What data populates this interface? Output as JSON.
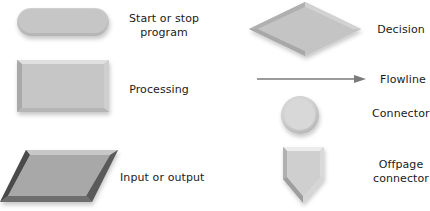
{
  "diagram": {
    "colors": {
      "fill": "#c4c4c4",
      "fill_light": "#d6d6d6",
      "bevel_dark": "#8a8a8a",
      "bevel_darker": "#555555",
      "bevel_light": "#e6e6e6",
      "flowline": "#7a7a7a",
      "text": "#1a1a1a"
    },
    "symbols": [
      {
        "id": "terminal",
        "shape": "rounded-rectangle",
        "label_line1": "Start or stop",
        "label_line2": "program"
      },
      {
        "id": "process",
        "shape": "rectangle",
        "label": "Processing"
      },
      {
        "id": "input-output",
        "shape": "parallelogram",
        "label": "Input or output"
      },
      {
        "id": "decision",
        "shape": "diamond",
        "label": "Decision"
      },
      {
        "id": "flowline",
        "shape": "arrow",
        "label": "Flowline"
      },
      {
        "id": "connector",
        "shape": "circle",
        "label": "Connector"
      },
      {
        "id": "offpage-connector",
        "shape": "pentagon-down",
        "label_line1": "Offpage",
        "label_line2": "connector"
      }
    ]
  }
}
